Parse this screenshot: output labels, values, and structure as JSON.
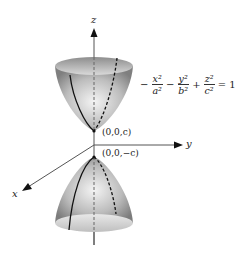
{
  "figure": {
    "axes": {
      "z_label": "z",
      "y_label": "y",
      "x_label": "x"
    },
    "points": {
      "upper_vertex": "(0,0,c)",
      "lower_vertex": "(0,0,−c)"
    },
    "equation": {
      "terms": [
        {
          "sign": "−",
          "num": "x²",
          "den": "a²"
        },
        {
          "sign": "−",
          "num": "y²",
          "den": "b²"
        },
        {
          "sign": "+",
          "num": "z²",
          "den": "c²"
        }
      ],
      "rhs": "= 1"
    },
    "colors": {
      "surface_dark": "#8a8a8a",
      "surface_light": "#f2f2f2",
      "axis": "#333333",
      "curve": "#111111"
    }
  }
}
